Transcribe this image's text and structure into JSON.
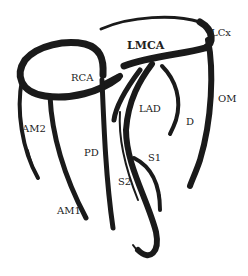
{
  "diagram": {
    "stroke_color": "#1a1a1a",
    "background": "#ffffff",
    "labels": [
      {
        "id": "lmca",
        "text": "LMCA",
        "x": 127,
        "y": 40,
        "bold": true
      },
      {
        "id": "lcx",
        "text": "LCx",
        "x": 211,
        "y": 28,
        "bold": false
      },
      {
        "id": "rca",
        "text": "RCA",
        "x": 71,
        "y": 73,
        "bold": false
      },
      {
        "id": "om",
        "text": "OM",
        "x": 218,
        "y": 94,
        "bold": false
      },
      {
        "id": "lad",
        "text": "LAD",
        "x": 139,
        "y": 104,
        "bold": false
      },
      {
        "id": "d",
        "text": "D",
        "x": 186,
        "y": 117,
        "bold": false
      },
      {
        "id": "am2",
        "text": "AM2",
        "x": 22,
        "y": 124,
        "bold": false
      },
      {
        "id": "pd",
        "text": "PD",
        "x": 84,
        "y": 148,
        "bold": false
      },
      {
        "id": "s1",
        "text": "S1",
        "x": 148,
        "y": 153,
        "bold": false
      },
      {
        "id": "s2",
        "text": "S2",
        "x": 118,
        "y": 177,
        "bold": false
      },
      {
        "id": "am1",
        "text": "AM1",
        "x": 57,
        "y": 206,
        "bold": false
      }
    ]
  }
}
